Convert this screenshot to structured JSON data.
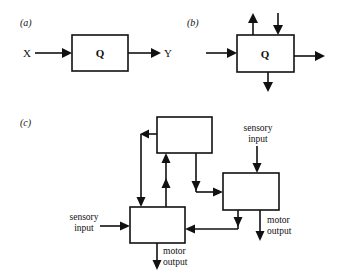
{
  "panels": {
    "a": {
      "label": "(a)",
      "box_label": "Q",
      "input_label": "X",
      "output_label": "Y"
    },
    "b": {
      "label": "(b)",
      "box_label": "Q"
    },
    "c": {
      "label": "(c)",
      "left_box": {
        "input_label_line1": "sensory",
        "input_label_line2": "input",
        "output_label_line1": "motor",
        "output_label_line2": "output"
      },
      "right_box": {
        "input_label_line1": "sensory",
        "input_label_line2": "input",
        "output_label_line1": "motor",
        "output_label_line2": "output"
      }
    }
  },
  "colors": {
    "stroke": "#111111",
    "background": "#ffffff"
  }
}
